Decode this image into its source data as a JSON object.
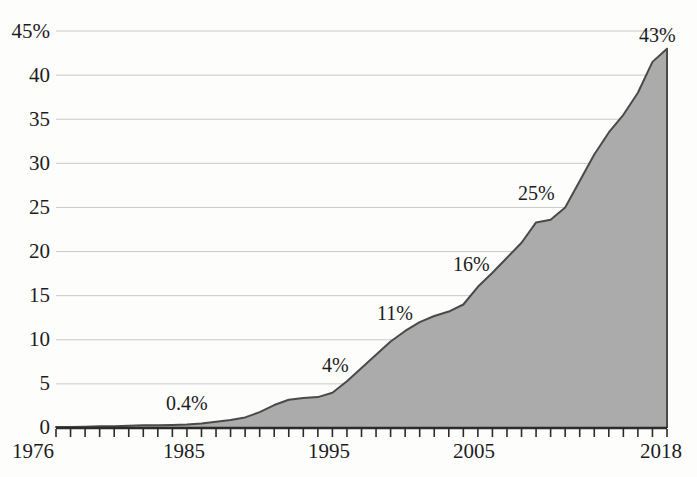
{
  "chart_data": {
    "type": "area",
    "title": "",
    "subtitle": "",
    "xlabel": "",
    "ylabel": "",
    "xlim": [
      1976,
      2018
    ],
    "ylim": [
      0,
      45
    ],
    "grid": true,
    "legend": null,
    "y_ticks": [
      "45%",
      "40",
      "35",
      "30",
      "25",
      "20",
      "15",
      "10",
      "5",
      "0"
    ],
    "y_tick_values": [
      45,
      40,
      35,
      30,
      25,
      20,
      15,
      10,
      5,
      0
    ],
    "x_ticks": [
      "1976",
      "1985",
      "1995",
      "2005",
      "2018"
    ],
    "x_tick_values": [
      1976,
      1985,
      1995,
      2005,
      2018
    ],
    "x_minor_tick_step": 1,
    "series": [
      {
        "name": "share",
        "fill_color": "#ababab",
        "line_color": "#4a4a4a",
        "x": [
          1976,
          1977,
          1978,
          1979,
          1980,
          1981,
          1982,
          1983,
          1984,
          1985,
          1986,
          1987,
          1988,
          1989,
          1990,
          1991,
          1992,
          1993,
          1994,
          1995,
          1996,
          1997,
          1998,
          1999,
          2000,
          2001,
          2002,
          2003,
          2004,
          2005,
          2006,
          2007,
          2008,
          2009,
          2010,
          2011,
          2012,
          2013,
          2014,
          2015,
          2016,
          2017,
          2018
        ],
        "values": [
          0.1,
          0.1,
          0.15,
          0.2,
          0.2,
          0.25,
          0.3,
          0.3,
          0.35,
          0.4,
          0.5,
          0.7,
          0.9,
          1.2,
          1.8,
          2.6,
          3.2,
          3.4,
          3.5,
          4.0,
          5.3,
          6.8,
          8.3,
          9.8,
          11.0,
          12.0,
          12.7,
          13.2,
          14.0,
          16.0,
          17.6,
          19.3,
          21.0,
          23.3,
          23.6,
          25.0,
          28.0,
          31.0,
          33.5,
          35.5,
          38.0,
          41.5,
          43.0
        ]
      }
    ],
    "point_labels": [
      {
        "text": "0.4%",
        "year": 1985,
        "value": 0.4,
        "x_px": 166,
        "y_px": 393
      },
      {
        "text": "4%",
        "year": 1995,
        "value": 4,
        "x_px": 322,
        "y_px": 355
      },
      {
        "text": "11%",
        "year": 2000,
        "value": 11,
        "x_px": 377,
        "y_px": 303
      },
      {
        "text": "16%",
        "year": 2005,
        "value": 16,
        "x_px": 453,
        "y_px": 254
      },
      {
        "text": "25%",
        "year": 2011,
        "value": 25,
        "x_px": 518,
        "y_px": 183
      },
      {
        "text": "43%",
        "year": 2018,
        "value": 43,
        "x_px": 639,
        "y_px": 25
      }
    ],
    "colors": {
      "background": "#fdfdfc",
      "gridline": "#c9c9c9",
      "axis": "#2b2b2b",
      "area_fill": "#ababab",
      "area_stroke": "#4a4a4a",
      "text": "#1c1c1c"
    }
  },
  "y_axis_labels": [
    {
      "text": "45%",
      "top": 21
    },
    {
      "text": "40",
      "top": 65
    },
    {
      "text": "35",
      "top": 109
    },
    {
      "text": "30",
      "top": 153
    },
    {
      "text": "25",
      "top": 197
    },
    {
      "text": "20",
      "top": 241
    },
    {
      "text": "15",
      "top": 285
    },
    {
      "text": "10",
      "top": 329
    },
    {
      "text": "5",
      "top": 373
    },
    {
      "text": "0",
      "top": 417
    }
  ],
  "x_axis_labels": [
    {
      "text": "1976",
      "left": 12
    },
    {
      "text": "1985",
      "left": 163
    },
    {
      "text": "1995",
      "left": 308
    },
    {
      "text": "2005",
      "left": 453
    },
    {
      "text": "2018",
      "left": 640
    }
  ]
}
